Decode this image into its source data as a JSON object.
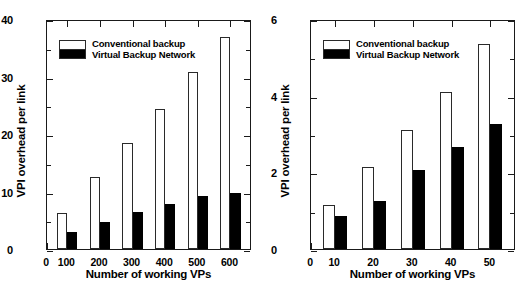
{
  "figure": {
    "panels": [
      {
        "id": "left",
        "xlabel": "Number of working VPs",
        "ylabel": "VPI overhead per link",
        "ytick_labels": [
          "0",
          "10",
          "20",
          "30",
          "40"
        ],
        "xtick_labels": [
          "0",
          "100",
          "200",
          "300",
          "400",
          "500",
          "600"
        ],
        "legend": {
          "conventional": "Conventional backup",
          "vbn": "Virtual Backup Network"
        }
      },
      {
        "id": "right",
        "xlabel": "Number of working VPs",
        "ylabel": "VPI overhead per link",
        "ytick_labels": [
          "0",
          "2",
          "4",
          "6"
        ],
        "xtick_labels": [
          "0",
          "10",
          "20",
          "30",
          "40",
          "50"
        ],
        "legend": {
          "conventional": "Conventional backup",
          "vbn": "Virtual Backup Network"
        }
      }
    ]
  },
  "chart_data": [
    {
      "type": "bar",
      "title": "",
      "xlabel": "Number of working VPs",
      "ylabel": "VPI overhead per link",
      "categories": [
        "100",
        "200",
        "300",
        "400",
        "500",
        "600"
      ],
      "xlim": [
        0,
        650
      ],
      "ylim": [
        0,
        40
      ],
      "yticks": [
        0,
        10,
        20,
        30,
        40
      ],
      "grid": false,
      "legend_position": "upper-left",
      "series": [
        {
          "name": "Conventional backup",
          "color": "#ffffff",
          "values": [
            6.2,
            12.5,
            18.5,
            24.3,
            30.8,
            36.8
          ]
        },
        {
          "name": "Virtual Backup Network",
          "color": "#000000",
          "values": [
            3.0,
            4.7,
            6.4,
            7.9,
            9.2,
            9.8
          ]
        }
      ]
    },
    {
      "type": "bar",
      "title": "",
      "xlabel": "Number of working VPs",
      "ylabel": "VPI overhead per link",
      "categories": [
        "10",
        "20",
        "30",
        "40",
        "50"
      ],
      "xlim": [
        0,
        58
      ],
      "ylim": [
        0,
        6
      ],
      "yticks": [
        0,
        2,
        4,
        6
      ],
      "grid": false,
      "legend_position": "upper-left",
      "series": [
        {
          "name": "Conventional backup",
          "color": "#ffffff",
          "values": [
            1.15,
            2.15,
            3.1,
            4.1,
            5.35
          ]
        },
        {
          "name": "Virtual Backup Network",
          "color": "#000000",
          "values": [
            0.85,
            1.25,
            2.05,
            2.65,
            3.25
          ]
        }
      ]
    }
  ]
}
